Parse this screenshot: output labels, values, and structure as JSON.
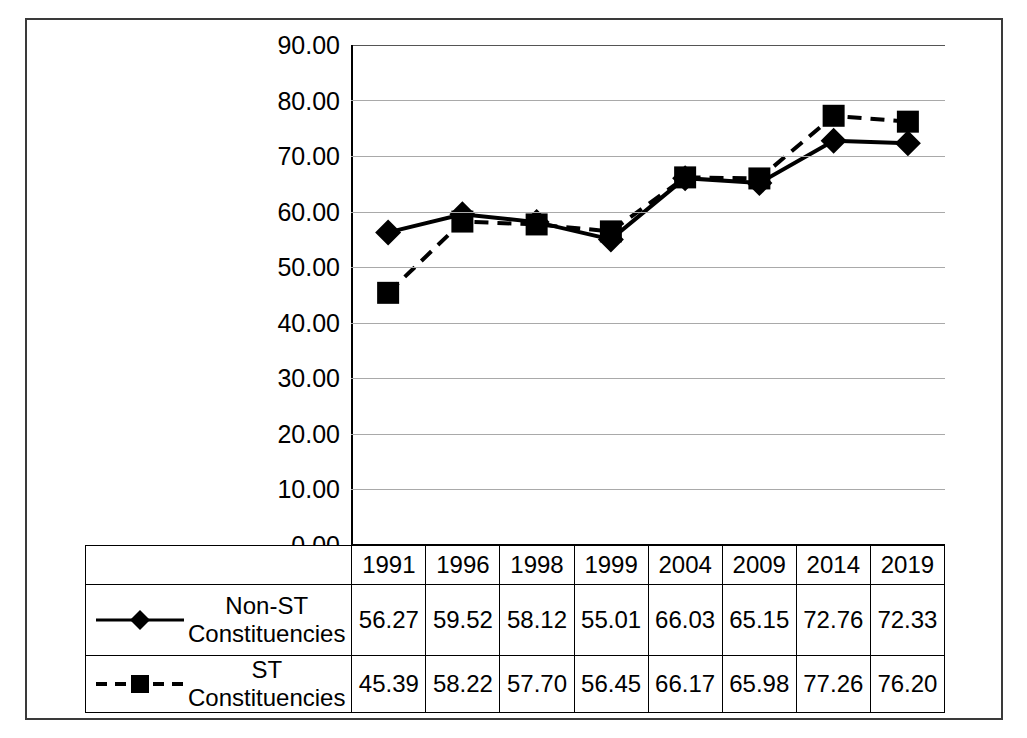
{
  "chart_data": {
    "type": "line",
    "title": "",
    "xlabel": "",
    "ylabel": "",
    "ylim": [
      0,
      90
    ],
    "ytick_step": 10,
    "grid": true,
    "legend_position": "bottom-table",
    "categories": [
      "1991",
      "1996",
      "1998",
      "1999",
      "2004",
      "2009",
      "2014",
      "2019"
    ],
    "series": [
      {
        "name": "Non-ST Constituencies",
        "marker": "diamond",
        "line_style": "solid",
        "color": "#000000",
        "values": [
          56.27,
          59.52,
          58.12,
          55.01,
          66.03,
          65.15,
          72.76,
          72.33
        ]
      },
      {
        "name": "ST Constituencies",
        "marker": "square",
        "line_style": "dashed",
        "color": "#000000",
        "values": [
          45.39,
          58.22,
          57.7,
          56.45,
          66.17,
          65.98,
          77.26,
          76.2
        ]
      }
    ],
    "ytick_labels": [
      "0.00",
      "10.00",
      "20.00",
      "30.00",
      "40.00",
      "50.00",
      "60.00",
      "70.00",
      "80.00",
      "90.00"
    ]
  },
  "axis": {
    "yticks": [
      "90.00",
      "80.00",
      "70.00",
      "60.00",
      "50.00",
      "40.00",
      "30.00",
      "20.00",
      "10.00",
      "0.00"
    ]
  },
  "table": {
    "year_header": [
      "1991",
      "1996",
      "1998",
      "1999",
      "2004",
      "2009",
      "2014",
      "2019"
    ],
    "rows": [
      {
        "label_line1": "Non-ST",
        "label_line2": "Constituencies",
        "label_full": "Non-ST Constituencies",
        "marker": "diamond-solid-line-key",
        "values": [
          "56.27",
          "59.52",
          "58.12",
          "55.01",
          "66.03",
          "65.15",
          "72.76",
          "72.33"
        ]
      },
      {
        "label_line1": "ST Constituencies",
        "label_line2": "",
        "label_full": "ST Constituencies",
        "marker": "square-dashed-line-key",
        "values": [
          "45.39",
          "58.22",
          "57.70",
          "56.45",
          "66.17",
          "65.98",
          "77.26",
          "76.20"
        ]
      }
    ]
  },
  "colors": {
    "ink": "#000000",
    "grid": "#a9a9a9",
    "frame": "#3a3a3a",
    "background": "#ffffff"
  }
}
